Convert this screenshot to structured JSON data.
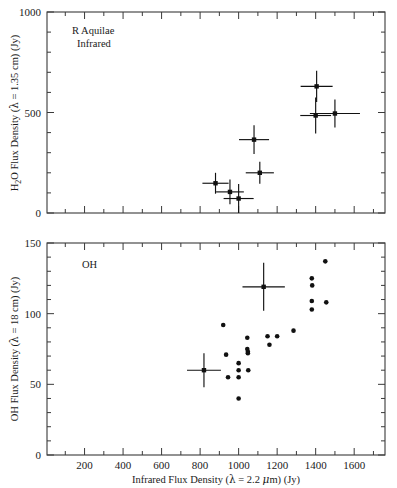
{
  "figure": {
    "width": 397,
    "height": 488,
    "background": "#ffffff",
    "ink_color": "#111111"
  },
  "xaxis": {
    "label": "Infrared Flux Density (λ = 2.2 μm) (Jy)",
    "label_parts": {
      "prefix": "Infrared Flux Density (",
      "lambda": "λ",
      "equals": " = 2.2 ",
      "mu": "μ",
      "suffix": "m) (Jy)"
    },
    "ticks": [
      200,
      400,
      600,
      800,
      1000,
      1200,
      1400,
      1600
    ],
    "tick_labels": [
      "200",
      "400",
      "600",
      "800",
      "1000",
      "1200",
      "1400",
      "1600"
    ],
    "minor_step": 100,
    "range": [
      5,
      1760
    ]
  },
  "panels": [
    {
      "id": "h2o-panel",
      "annotation_lines": [
        "R Aquilae",
        "Infrared"
      ],
      "ylabel": "H2O Flux Density (λ = 1.35 cm) (Jy)",
      "ylabel_parts": {
        "pre": "H",
        "sub": "2",
        "post": "O Flux Density (",
        "lambda": "λ",
        "tail": " = 1.35 cm) (Jy)"
      },
      "yticks": [
        0,
        500,
        1000
      ],
      "ytick_labels": [
        "0",
        "500",
        "1000"
      ],
      "yminor_step": 100,
      "ylim": [
        0,
        1000
      ]
    },
    {
      "id": "oh-panel",
      "annotation_lines": [
        "OH"
      ],
      "ylabel": "OH Flux Density (λ = 18 cm) (Jy)",
      "ylabel_parts": {
        "pre": "OH Flux Density (",
        "lambda": "λ",
        "tail": " = 18 cm) (Jy)"
      },
      "yticks": [
        0,
        50,
        100,
        150
      ],
      "ytick_labels": [
        "0",
        "50",
        "100",
        "150"
      ],
      "yminor_step": 10,
      "ylim": [
        0,
        150
      ]
    }
  ],
  "chart_data": [
    {
      "type": "scatter",
      "id": "h2o-vs-infrared",
      "title": "R Aquilae Infrared",
      "xlabel": "Infrared Flux Density (λ = 2.2 μm) (Jy)",
      "ylabel": "H2O Flux Density (λ = 1.35 cm) (Jy)",
      "xlim": [
        5,
        1760
      ],
      "ylim": [
        0,
        1000
      ],
      "grid": false,
      "legend": null,
      "error_bars": true,
      "points": [
        {
          "x": 880,
          "y": 148,
          "xerr": 68,
          "yerr": 52
        },
        {
          "x": 955,
          "y": 105,
          "xerr": 72,
          "yerr": 62
        },
        {
          "x": 1000,
          "y": 72,
          "xerr": 78,
          "yerr": 72
        },
        {
          "x": 1110,
          "y": 200,
          "xerr": 73,
          "yerr": 55
        },
        {
          "x": 1080,
          "y": 365,
          "xerr": 78,
          "yerr": 72
        },
        {
          "x": 1405,
          "y": 630,
          "xerr": 83,
          "yerr": 78
        },
        {
          "x": 1400,
          "y": 485,
          "xerr": 80,
          "yerr": 90
        },
        {
          "x": 1500,
          "y": 495,
          "xerr": 130,
          "yerr": 70
        }
      ]
    },
    {
      "type": "scatter",
      "id": "oh-vs-infrared",
      "title": "OH",
      "xlabel": "Infrared Flux Density (λ = 2.2 μm) (Jy)",
      "ylabel": "OH Flux Density (λ = 18 cm) (Jy)",
      "xlim": [
        5,
        1760
      ],
      "ylim": [
        0,
        150
      ],
      "grid": false,
      "legend": null,
      "error_bars": true,
      "points": [
        {
          "x": 920,
          "y": 92
        },
        {
          "x": 935,
          "y": 71
        },
        {
          "x": 945,
          "y": 55
        },
        {
          "x": 1000,
          "y": 65
        },
        {
          "x": 1000,
          "y": 60
        },
        {
          "x": 1000,
          "y": 55
        },
        {
          "x": 1000,
          "y": 40
        },
        {
          "x": 1045,
          "y": 83
        },
        {
          "x": 1045,
          "y": 75
        },
        {
          "x": 1048,
          "y": 73
        },
        {
          "x": 1048,
          "y": 72
        },
        {
          "x": 1050,
          "y": 60
        },
        {
          "x": 1160,
          "y": 78
        },
        {
          "x": 1150,
          "y": 84
        },
        {
          "x": 1200,
          "y": 84
        },
        {
          "x": 1285,
          "y": 88
        },
        {
          "x": 1380,
          "y": 125
        },
        {
          "x": 1382,
          "y": 120
        },
        {
          "x": 1380,
          "y": 109
        },
        {
          "x": 1380,
          "y": 103
        },
        {
          "x": 1450,
          "y": 137
        },
        {
          "x": 1455,
          "y": 108
        }
      ],
      "error_points": [
        {
          "x": 820,
          "y": 60,
          "xerr": 88,
          "yerr": 12
        },
        {
          "x": 1130,
          "y": 119,
          "xerr": 110,
          "yerr": 17
        }
      ]
    }
  ]
}
